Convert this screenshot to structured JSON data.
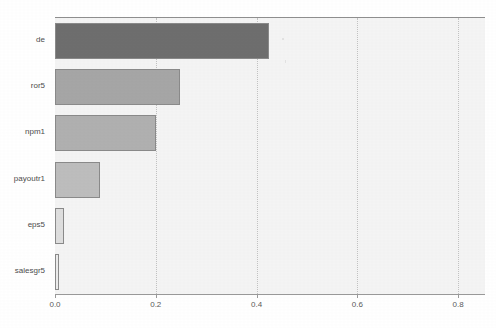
{
  "chart_data": {
    "type": "bar",
    "orientation": "horizontal",
    "title": "",
    "xlabel": "",
    "ylabel": "",
    "categories": [
      "de",
      "ror5",
      "npm1",
      "payoutr1",
      "eps5",
      "salesgr5"
    ],
    "values": [
      0.425,
      0.248,
      0.2,
      0.09,
      0.017,
      0.007
    ],
    "bar_colors": [
      "#6e6e6e",
      "#a6a6a6",
      "#b0b0b0",
      "#bdbdbd",
      "#dedede",
      "#ececec"
    ],
    "bar_edge_color": "#8a8a8a",
    "xlim": [
      0.0,
      0.8535
    ],
    "xticks": [
      0.0,
      0.2,
      0.4,
      0.6,
      0.8
    ],
    "xtick_labels": [
      "0.0",
      "0.2",
      "0.4",
      "0.6",
      "0.8"
    ],
    "grid": true,
    "grid_axis": "x",
    "grid_style": "dotted",
    "legend": false,
    "plot_background": "#f4f4f4",
    "figure_background": "#ffffff"
  },
  "axis": {
    "ticks": [
      {
        "label": "0.0",
        "value": 0.0
      },
      {
        "label": "0.2",
        "value": 0.2
      },
      {
        "label": "0.4",
        "value": 0.4
      },
      {
        "label": "0.6",
        "value": 0.6
      },
      {
        "label": "0.8",
        "value": 0.8
      }
    ]
  },
  "bars": [
    {
      "label": "de",
      "value": 0.425,
      "color": "#6e6e6e"
    },
    {
      "label": "ror5",
      "value": 0.248,
      "color": "#a6a6a6"
    },
    {
      "label": "npm1",
      "value": 0.2,
      "color": "#b0b0b0"
    },
    {
      "label": "payoutr1",
      "value": 0.09,
      "color": "#bdbdbd"
    },
    {
      "label": "eps5",
      "value": 0.017,
      "color": "#dedede"
    },
    {
      "label": "salesgr5",
      "value": 0.007,
      "color": "#ececec"
    }
  ]
}
